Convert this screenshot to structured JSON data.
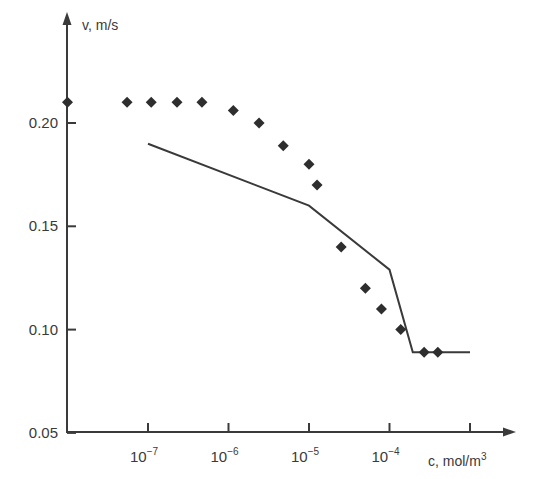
{
  "chart_data": {
    "type": "line+scatter",
    "title": "",
    "xlabel": "c, mol/m3",
    "ylabel": "v, m/s",
    "xscale": "log",
    "x_tick_labels": [
      "10^-7",
      "10^-6",
      "10^-5",
      "10^-4"
    ],
    "x_tick_exponents": [
      -7,
      -6,
      -5,
      -4,
      -3
    ],
    "x_tick_labeled": [
      true,
      true,
      true,
      true,
      false
    ],
    "y_ticks": [
      0.05,
      0.1,
      0.15,
      0.2
    ],
    "y_tick_labels": [
      "0.05",
      "0.10",
      "0.15",
      "0.20"
    ],
    "xlim_log10": [
      -8.0,
      -2.5
    ],
    "ylim": [
      0.05,
      0.22
    ],
    "grid": false,
    "legend": null,
    "series": [
      {
        "name": "experimental points",
        "style": "diamond-markers",
        "log10_x": [
          -8.0,
          -7.26,
          -6.96,
          -6.64,
          -6.33,
          -5.94,
          -5.62,
          -5.32,
          -5.0,
          -4.9,
          -4.6,
          -4.3,
          -4.1,
          -3.86,
          -3.57,
          -3.4
        ],
        "x": [
          1e-08,
          5.5e-08,
          1.1e-07,
          2.3e-07,
          4.7e-07,
          1.15e-06,
          2.4e-06,
          4.8e-06,
          1e-05,
          1.26e-05,
          2.5e-05,
          5e-05,
          8e-05,
          0.00014,
          0.00027,
          0.0004
        ],
        "y": [
          0.21,
          0.21,
          0.21,
          0.21,
          0.21,
          0.206,
          0.2,
          0.189,
          0.18,
          0.17,
          0.14,
          0.12,
          0.11,
          0.1,
          0.089,
          0.089
        ]
      },
      {
        "name": "calculated curve",
        "style": "solid-line",
        "log10_x": [
          -7.0,
          -5.0,
          -4.0,
          -3.71,
          -3.0
        ],
        "x": [
          1e-07,
          1e-05,
          0.0001,
          0.000195,
          0.001
        ],
        "y": [
          0.19,
          0.16,
          0.129,
          0.089,
          0.089
        ]
      }
    ]
  },
  "labels": {
    "y_axis_title": "v, m/s",
    "x_axis_title_prefix": "c, mol/m",
    "x_axis_title_sup": "3",
    "x_tick_base": "10",
    "x_tick_exps": [
      "−7",
      "−6",
      "−5",
      "−4"
    ]
  },
  "colors": {
    "axis": "#3a3a3a",
    "markers": "#2e2e2e",
    "line": "#3a3a3a",
    "background": "#ffffff"
  }
}
